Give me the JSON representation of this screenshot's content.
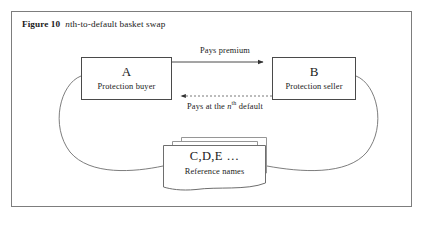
{
  "figure": {
    "label": "Figure 10",
    "caption_prefix_italic": "n",
    "caption_rest": "th-to-default basket swap",
    "frame_color": "#7d7d7d",
    "background": "#ffffff",
    "line_color": "#4a4a4a"
  },
  "nodes": {
    "a": {
      "title": "A",
      "subtitle": "Protection buyer"
    },
    "b": {
      "title": "B",
      "subtitle": "Protection seller"
    },
    "reference": {
      "title": "C,D,E …",
      "subtitle": "Reference names",
      "stack_count": 3
    }
  },
  "edges": {
    "premium": {
      "label": "Pays premium",
      "style": "solid",
      "direction": "a-to-b"
    },
    "payout": {
      "label_pre": "Pays at the ",
      "label_italic": "n",
      "label_sup": "th",
      "label_post": " default",
      "style": "dashed",
      "direction": "b-to-a"
    },
    "basket_left": {
      "style": "curve",
      "from": "a",
      "to": "reference"
    },
    "basket_right": {
      "style": "curve",
      "from": "b",
      "to": "reference"
    }
  }
}
